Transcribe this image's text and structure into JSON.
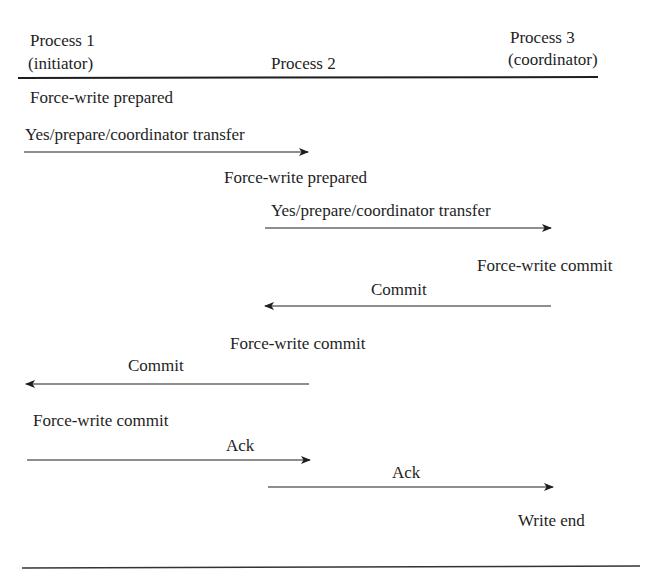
{
  "diagram": {
    "type": "sequence",
    "participants": [
      {
        "id": "p1",
        "name": "Process 1",
        "role": "(initiator)"
      },
      {
        "id": "p2",
        "name": "Process 2",
        "role": ""
      },
      {
        "id": "p3",
        "name": "Process 3",
        "role": "(coordinator)"
      }
    ],
    "events": [
      {
        "kind": "action",
        "at": "p1",
        "label": "Force-write prepared"
      },
      {
        "kind": "message",
        "from": "p1",
        "to": "p2",
        "label": "Yes/prepare/coordinator transfer"
      },
      {
        "kind": "action",
        "at": "p2",
        "label": "Force-write prepared"
      },
      {
        "kind": "message",
        "from": "p2",
        "to": "p3",
        "label": "Yes/prepare/coordinator transfer"
      },
      {
        "kind": "action",
        "at": "p3",
        "label": "Force-write commit"
      },
      {
        "kind": "message",
        "from": "p3",
        "to": "p2",
        "label": "Commit"
      },
      {
        "kind": "action",
        "at": "p2",
        "label": "Force-write commit"
      },
      {
        "kind": "message",
        "from": "p2",
        "to": "p1",
        "label": "Commit"
      },
      {
        "kind": "action",
        "at": "p1",
        "label": "Force-write commit"
      },
      {
        "kind": "message",
        "from": "p1",
        "to": "p2",
        "label": "Ack"
      },
      {
        "kind": "message",
        "from": "p2",
        "to": "p3",
        "label": "Ack"
      },
      {
        "kind": "action",
        "at": "p3",
        "label": "Write end"
      }
    ],
    "colors": {
      "line": "#1e1e1e",
      "text": "#1e1e1e",
      "background": "#ffffff"
    }
  }
}
